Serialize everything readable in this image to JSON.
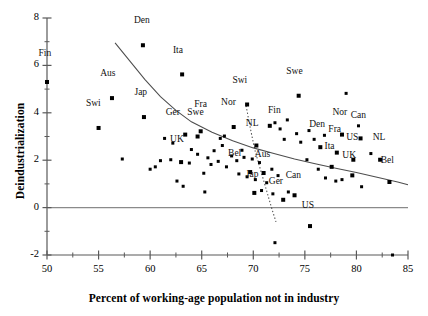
{
  "chart_data": {
    "type": "scatter",
    "title": "",
    "xlabel": "Percent of working-age population not in industry",
    "ylabel": "Deindustrialization",
    "xlim": [
      50,
      85
    ],
    "ylim": [
      -2,
      8
    ],
    "xticks": [
      50,
      55,
      60,
      65,
      70,
      75,
      80,
      85
    ],
    "xtick_labels": [
      "50",
      "55",
      "60",
      "65",
      "70",
      "75",
      "80",
      "85"
    ],
    "xminor_step": 2.5,
    "yticks": [
      -2,
      0,
      2,
      4,
      6,
      8
    ],
    "ytick_labels": [
      "-2",
      "0",
      "2",
      "4",
      "6",
      "8"
    ],
    "yminor_step": 1,
    "grid": false,
    "legend": "none",
    "marker": "filled-square",
    "marker_color": "#000000",
    "zero_line": true,
    "points": [
      {
        "x": 50.0,
        "y": 5.3,
        "label": "Fin",
        "lx": -0.4,
        "ly": 0.95
      },
      {
        "x": 59.3,
        "y": 6.85,
        "label": "Den",
        "lx": -0.3,
        "ly": 0.8
      },
      {
        "x": 63.1,
        "y": 5.62,
        "label": "Ita",
        "lx": -0.6,
        "ly": 0.78
      },
      {
        "x": 56.3,
        "y": 4.62,
        "label": "Aus",
        "lx": -0.6,
        "ly": 0.8
      },
      {
        "x": 79.0,
        "y": 4.82,
        "label": "",
        "lx": 0,
        "ly": 0
      },
      {
        "x": 59.4,
        "y": 3.82,
        "label": "Jap",
        "lx": -0.5,
        "ly": 0.8
      },
      {
        "x": 55.0,
        "y": 3.36,
        "label": "Swi",
        "lx": -0.7,
        "ly": 0.8
      },
      {
        "x": 69.4,
        "y": 4.35,
        "label": "Swi",
        "lx": -0.9,
        "ly": 0.78
      },
      {
        "x": 74.4,
        "y": 4.72,
        "label": "Swe",
        "lx": -0.6,
        "ly": 0.8
      },
      {
        "x": 63.4,
        "y": 3.08,
        "label": "Ger",
        "lx": -1.4,
        "ly": 0.72
      },
      {
        "x": 64.6,
        "y": 3.0,
        "label": "Swe",
        "lx": -0.4,
        "ly": 0.78
      },
      {
        "x": 64.9,
        "y": 3.22,
        "label": "Fra",
        "lx": -0.2,
        "ly": 0.9
      },
      {
        "x": 68.1,
        "y": 3.4,
        "label": "Nor",
        "lx": -0.7,
        "ly": 0.82
      },
      {
        "x": 71.6,
        "y": 3.45,
        "label": "Fin",
        "lx": 0.25,
        "ly": 0.42
      },
      {
        "x": 70.3,
        "y": 2.62,
        "label": "NL",
        "lx": -0.6,
        "ly": 0.68
      },
      {
        "x": 76.5,
        "y": 2.55,
        "label": "Den",
        "lx": -0.5,
        "ly": 0.72
      },
      {
        "x": 78.6,
        "y": 3.08,
        "label": "Nor",
        "lx": -0.4,
        "ly": 0.7
      },
      {
        "x": 80.4,
        "y": 2.92,
        "label": "Can",
        "lx": -0.4,
        "ly": 0.72
      },
      {
        "x": 78.1,
        "y": 2.32,
        "label": "Fra",
        "lx": -0.4,
        "ly": 0.74
      },
      {
        "x": 79.7,
        "y": 2.02,
        "label": "US",
        "lx": -0.3,
        "ly": 0.72
      },
      {
        "x": 82.3,
        "y": 2.02,
        "label": "NL",
        "lx": -0.3,
        "ly": 0.72
      },
      {
        "x": 77.6,
        "y": 1.72,
        "label": "Ita",
        "lx": -0.4,
        "ly": 0.62
      },
      {
        "x": 63.0,
        "y": 1.92,
        "label": "UK",
        "lx": -0.6,
        "ly": 0.72
      },
      {
        "x": 79.6,
        "y": 1.36,
        "label": "UK",
        "lx": -0.5,
        "ly": 0.62
      },
      {
        "x": 83.2,
        "y": 1.08,
        "label": "Bel",
        "lx": -0.4,
        "ly": 0.68
      },
      {
        "x": 69.7,
        "y": 1.5,
        "label": "Bel",
        "lx": -1.7,
        "ly": 0.56
      },
      {
        "x": 71.0,
        "y": 1.46,
        "label": "Aus",
        "lx": -0.3,
        "ly": 0.56
      },
      {
        "x": 70.1,
        "y": 0.62,
        "label": "Jap",
        "lx": -0.4,
        "ly": 0.56
      },
      {
        "x": 72.9,
        "y": 0.33,
        "label": "Ger",
        "lx": -0.9,
        "ly": 0.54
      },
      {
        "x": 74.0,
        "y": 0.52,
        "label": "Can",
        "lx": -0.3,
        "ly": 0.6
      },
      {
        "x": 75.5,
        "y": -0.78,
        "label": "US",
        "lx": -0.4,
        "ly": 0.62
      },
      {
        "x": 57.3,
        "y": 2.05,
        "label": "",
        "lx": 0,
        "ly": 0
      },
      {
        "x": 60.0,
        "y": 1.62,
        "label": "",
        "lx": 0,
        "ly": 0
      },
      {
        "x": 60.5,
        "y": 1.72,
        "label": "",
        "lx": 0,
        "ly": 0
      },
      {
        "x": 62.6,
        "y": 1.12,
        "label": "",
        "lx": 0,
        "ly": 0
      },
      {
        "x": 63.2,
        "y": 0.9,
        "label": "",
        "lx": 0,
        "ly": 0
      },
      {
        "x": 65.3,
        "y": 0.66,
        "label": "",
        "lx": 0,
        "ly": 0
      },
      {
        "x": 65.2,
        "y": 1.45,
        "label": "",
        "lx": 0,
        "ly": 0
      },
      {
        "x": 64.0,
        "y": 2.45,
        "label": "",
        "lx": 0,
        "ly": 0
      },
      {
        "x": 64.6,
        "y": 2.25,
        "label": "",
        "lx": 0,
        "ly": 0
      },
      {
        "x": 65.6,
        "y": 2.1,
        "label": "",
        "lx": 0,
        "ly": 0
      },
      {
        "x": 66.2,
        "y": 2.4,
        "label": "",
        "lx": 0,
        "ly": 0
      },
      {
        "x": 66.6,
        "y": 1.95,
        "label": "",
        "lx": 0,
        "ly": 0
      },
      {
        "x": 65.9,
        "y": 1.82,
        "label": "",
        "lx": 0,
        "ly": 0
      },
      {
        "x": 62.2,
        "y": 2.72,
        "label": "",
        "lx": 0,
        "ly": 0
      },
      {
        "x": 61.4,
        "y": 2.92,
        "label": "",
        "lx": 0,
        "ly": 0
      },
      {
        "x": 66.8,
        "y": 2.92,
        "label": "",
        "lx": 0,
        "ly": 0
      },
      {
        "x": 67.0,
        "y": 2.62,
        "label": "",
        "lx": 0,
        "ly": 0
      },
      {
        "x": 67.9,
        "y": 2.18,
        "label": "",
        "lx": 0,
        "ly": 0
      },
      {
        "x": 68.4,
        "y": 1.98,
        "label": "",
        "lx": 0,
        "ly": 0
      },
      {
        "x": 67.4,
        "y": 1.72,
        "label": "",
        "lx": 0,
        "ly": 0
      },
      {
        "x": 68.9,
        "y": 2.42,
        "label": "",
        "lx": 0,
        "ly": 0
      },
      {
        "x": 69.1,
        "y": 2.12,
        "label": "",
        "lx": 0,
        "ly": 0
      },
      {
        "x": 69.9,
        "y": 2.05,
        "label": "",
        "lx": 0,
        "ly": 0
      },
      {
        "x": 70.6,
        "y": 1.9,
        "label": "",
        "lx": 0,
        "ly": 0
      },
      {
        "x": 68.6,
        "y": 1.42,
        "label": "",
        "lx": 0,
        "ly": 0
      },
      {
        "x": 69.4,
        "y": 1.3,
        "label": "",
        "lx": 0,
        "ly": 0
      },
      {
        "x": 70.2,
        "y": 1.18,
        "label": "",
        "lx": 0,
        "ly": 0
      },
      {
        "x": 71.3,
        "y": 1.05,
        "label": "",
        "lx": 0,
        "ly": 0
      },
      {
        "x": 71.8,
        "y": 1.62,
        "label": "",
        "lx": 0,
        "ly": 0
      },
      {
        "x": 72.4,
        "y": 1.35,
        "label": "",
        "lx": 0,
        "ly": 0
      },
      {
        "x": 70.8,
        "y": 0.72,
        "label": "",
        "lx": 0,
        "ly": 0
      },
      {
        "x": 71.9,
        "y": 0.58,
        "label": "",
        "lx": 0,
        "ly": 0
      },
      {
        "x": 73.4,
        "y": 0.66,
        "label": "",
        "lx": 0,
        "ly": 0
      },
      {
        "x": 72.1,
        "y": 3.58,
        "label": "",
        "lx": 0,
        "ly": 0
      },
      {
        "x": 72.6,
        "y": 3.32,
        "label": "",
        "lx": 0,
        "ly": 0
      },
      {
        "x": 73.3,
        "y": 3.7,
        "label": "",
        "lx": 0,
        "ly": 0
      },
      {
        "x": 74.2,
        "y": 3.12,
        "label": "",
        "lx": 0,
        "ly": 0
      },
      {
        "x": 73.0,
        "y": 2.88,
        "label": "",
        "lx": 0,
        "ly": 0
      },
      {
        "x": 74.6,
        "y": 2.76,
        "label": "",
        "lx": 0,
        "ly": 0
      },
      {
        "x": 75.4,
        "y": 3.25,
        "label": "",
        "lx": 0,
        "ly": 0
      },
      {
        "x": 75.9,
        "y": 2.88,
        "label": "",
        "lx": 0,
        "ly": 0
      },
      {
        "x": 76.9,
        "y": 3.05,
        "label": "",
        "lx": 0,
        "ly": 0
      },
      {
        "x": 75.2,
        "y": 2.02,
        "label": "",
        "lx": 0,
        "ly": 0
      },
      {
        "x": 76.3,
        "y": 1.62,
        "label": "",
        "lx": 0,
        "ly": 0
      },
      {
        "x": 77.0,
        "y": 1.25,
        "label": "",
        "lx": 0,
        "ly": 0
      },
      {
        "x": 78.0,
        "y": 1.12,
        "label": "",
        "lx": 0,
        "ly": 0
      },
      {
        "x": 78.6,
        "y": 1.18,
        "label": "",
        "lx": 0,
        "ly": 0
      },
      {
        "x": 80.5,
        "y": 0.88,
        "label": "",
        "lx": 0,
        "ly": 0
      },
      {
        "x": 81.4,
        "y": 2.28,
        "label": "",
        "lx": 0,
        "ly": 0
      },
      {
        "x": 80.2,
        "y": 3.45,
        "label": "",
        "lx": 0,
        "ly": 0
      },
      {
        "x": 61.0,
        "y": 1.98,
        "label": "",
        "lx": 0,
        "ly": 0
      },
      {
        "x": 72.1,
        "y": -1.48,
        "label": "",
        "lx": 0,
        "ly": 0
      },
      {
        "x": 83.5,
        "y": -2.0,
        "label": "",
        "lx": 0,
        "ly": 0
      },
      {
        "x": 67.2,
        "y": 3.02,
        "label": "",
        "lx": 0,
        "ly": 0
      },
      {
        "x": 62.0,
        "y": 2.02,
        "label": "",
        "lx": 0,
        "ly": 0
      },
      {
        "x": 63.8,
        "y": 1.88,
        "label": "",
        "lx": 0,
        "ly": 0
      }
    ],
    "fit_curve_main": {
      "style": "solid",
      "points": [
        [
          56.6,
          6.95
        ],
        [
          58.0,
          6.2
        ],
        [
          59.5,
          5.4
        ],
        [
          61.0,
          4.68
        ],
        [
          62.5,
          4.1
        ],
        [
          64.0,
          3.62
        ],
        [
          66.0,
          3.18
        ],
        [
          68.0,
          2.82
        ],
        [
          70.0,
          2.52
        ],
        [
          72.0,
          2.28
        ],
        [
          74.0,
          2.05
        ],
        [
          76.0,
          1.85
        ],
        [
          78.0,
          1.66
        ],
        [
          80.0,
          1.48
        ],
        [
          82.0,
          1.28
        ],
        [
          84.0,
          1.08
        ],
        [
          85.0,
          0.96
        ]
      ]
    },
    "fit_curve_secondary": {
      "style": "dotted",
      "points": [
        [
          69.3,
          4.3
        ],
        [
          69.6,
          3.6
        ],
        [
          69.9,
          2.95
        ],
        [
          70.2,
          2.35
        ],
        [
          70.6,
          1.75
        ],
        [
          71.0,
          1.15
        ],
        [
          71.4,
          0.55
        ],
        [
          71.8,
          -0.05
        ],
        [
          72.2,
          -0.6
        ]
      ]
    }
  },
  "caption": ""
}
